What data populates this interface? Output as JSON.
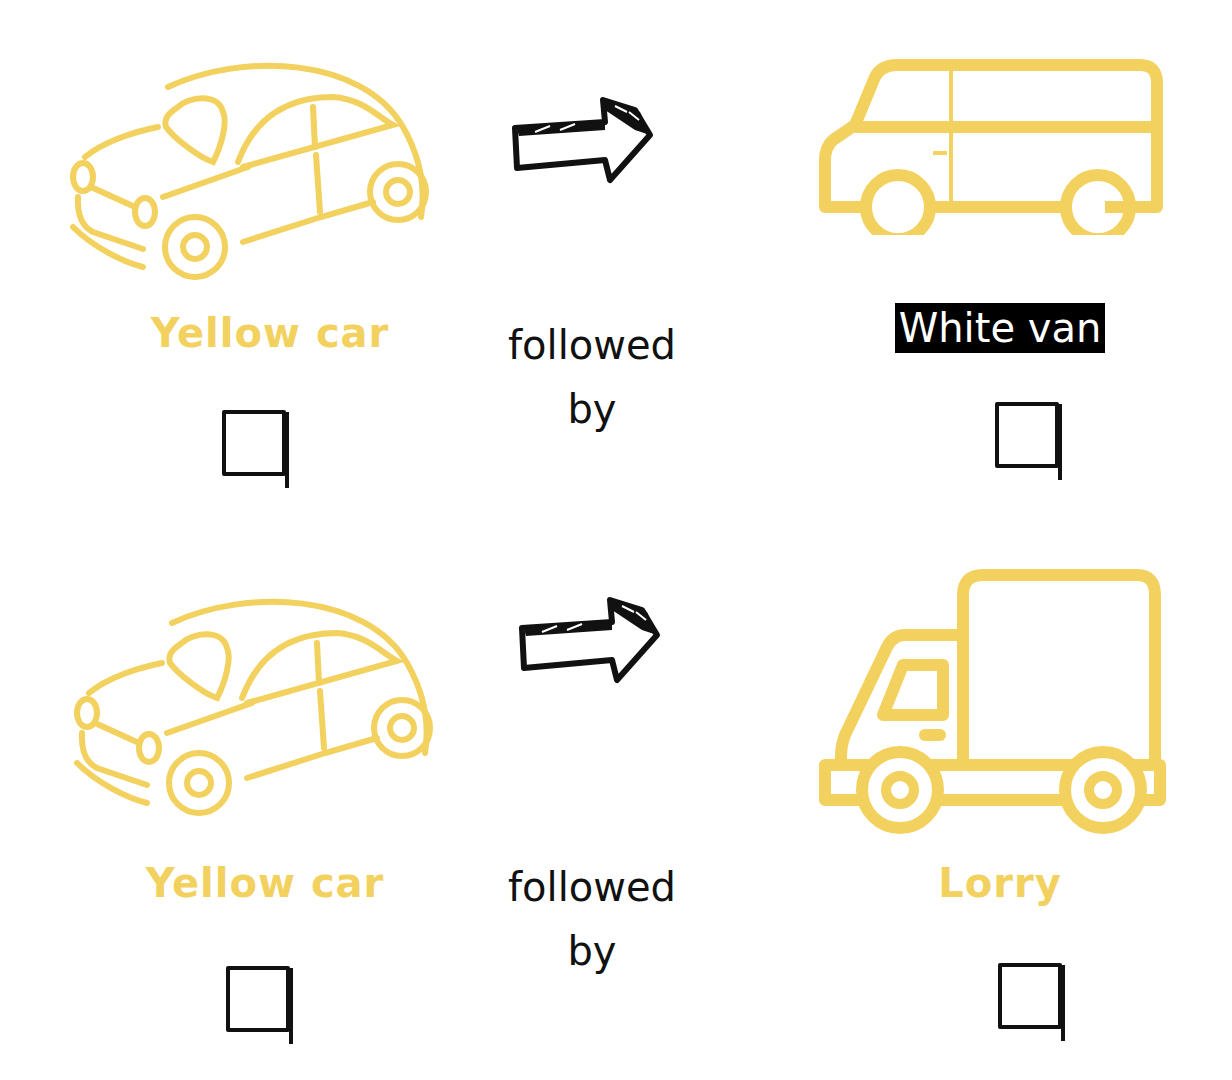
{
  "colors": {
    "vehicle_yellow": "#f2d15e",
    "ink": "#111111",
    "highlight_bg": "#000000",
    "highlight_fg": "#ffffff"
  },
  "rows": [
    {
      "left": {
        "icon": "car-icon",
        "label": "Yellow car"
      },
      "connector": {
        "icon": "arrow-right-icon",
        "text_line1": "followed",
        "text_line2": "by"
      },
      "right": {
        "icon": "van-icon",
        "label": "White van",
        "highlighted": true
      }
    },
    {
      "left": {
        "icon": "car-icon",
        "label": "Yellow car"
      },
      "connector": {
        "icon": "arrow-right-icon",
        "text_line1": "followed",
        "text_line2": "by"
      },
      "right": {
        "icon": "lorry-icon",
        "label": "Lorry",
        "highlighted": false
      }
    }
  ]
}
